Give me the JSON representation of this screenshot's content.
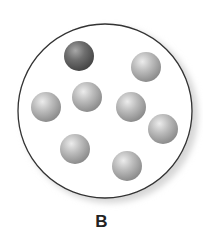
{
  "diagram": {
    "label": "B",
    "container": {
      "cx": 105,
      "cy": 111,
      "r": 87,
      "stroke": "#333333",
      "shadow": "#cfcfcf"
    },
    "particles": [
      {
        "cx": 79,
        "cy": 56,
        "r": 15,
        "type": "dark",
        "color": "#6e6e6e"
      },
      {
        "cx": 146,
        "cy": 67,
        "r": 15,
        "type": "light",
        "color": "#b3b3b3"
      },
      {
        "cx": 46,
        "cy": 107,
        "r": 15,
        "type": "light",
        "color": "#b3b3b3"
      },
      {
        "cx": 87,
        "cy": 97,
        "r": 15,
        "type": "light",
        "color": "#b3b3b3"
      },
      {
        "cx": 131,
        "cy": 107,
        "r": 15,
        "type": "light",
        "color": "#b3b3b3"
      },
      {
        "cx": 163,
        "cy": 129,
        "r": 15,
        "type": "light",
        "color": "#b3b3b3"
      },
      {
        "cx": 75,
        "cy": 149,
        "r": 15,
        "type": "light",
        "color": "#b3b3b3"
      },
      {
        "cx": 127,
        "cy": 166,
        "r": 15,
        "type": "light",
        "color": "#b3b3b3"
      }
    ]
  }
}
